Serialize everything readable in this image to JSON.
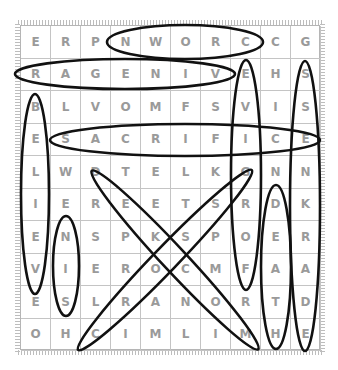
{
  "puzzle": {
    "rows": [
      [
        "E",
        "R",
        "P",
        "N",
        "W",
        "O",
        "R",
        "C",
        "C",
        "G"
      ],
      [
        "R",
        "A",
        "G",
        "E",
        "N",
        "I",
        "V",
        "E",
        "H",
        "S"
      ],
      [
        "B",
        "L",
        "V",
        "O",
        "M",
        "F",
        "S",
        "V",
        "I",
        "S"
      ],
      [
        "E",
        "S",
        "A",
        "C",
        "R",
        "I",
        "F",
        "I",
        "C",
        "E"
      ],
      [
        "L",
        "W",
        "D",
        "T",
        "E",
        "L",
        "K",
        "G",
        "N",
        "N"
      ],
      [
        "I",
        "E",
        "R",
        "E",
        "E",
        "T",
        "S",
        "R",
        "D",
        "K"
      ],
      [
        "E",
        "N",
        "S",
        "P",
        "K",
        "S",
        "P",
        "O",
        "E",
        "R"
      ],
      [
        "V",
        "I",
        "E",
        "R",
        "O",
        "C",
        "M",
        "F",
        "A",
        "A"
      ],
      [
        "E",
        "S",
        "L",
        "R",
        "A",
        "N",
        "O",
        "R",
        "T",
        "D"
      ],
      [
        "O",
        "H",
        "C",
        "I",
        "M",
        "L",
        "I",
        "M",
        "H",
        "E"
      ]
    ],
    "found_words": [
      {
        "word": "CROWN",
        "direction": "horizontal-reversed",
        "row": 1,
        "from_col": 4,
        "to_col": 8
      },
      {
        "word": "VINEGAR",
        "direction": "horizontal-reversed",
        "row": 2,
        "from_col": 1,
        "to_col": 7
      },
      {
        "word": "SACRIFICE",
        "direction": "horizontal",
        "row": 4,
        "from_col": 2,
        "to_col": 10
      },
      {
        "word": "BELIEVE",
        "direction": "vertical",
        "col": 1,
        "from_row": 3,
        "to_row": 9
      },
      {
        "word": "SIN",
        "direction": "vertical-reversed",
        "col": 2,
        "from_row": 7,
        "to_row": 9
      },
      {
        "word": "FORGIVE",
        "direction": "vertical-reversed",
        "col": 8,
        "from_row": 2,
        "to_row": 8
      },
      {
        "word": "DARKNESS",
        "direction": "vertical-reversed",
        "col": 10,
        "from_row": 2,
        "to_row": 9
      },
      {
        "word": "DEATH",
        "direction": "vertical",
        "col": 9,
        "from_row": 6,
        "to_row": 10
      },
      {
        "word": "MOCKED",
        "direction": "diagonal-reversed",
        "from": [
          5,
          3
        ],
        "to": [
          10,
          8
        ]
      },
      {
        "word": "CROSS",
        "direction": "diagonal-reversed",
        "from": [
          6,
          7
        ],
        "to": [
          10,
          3
        ]
      }
    ],
    "colors": {
      "letter": "#9a9a9a",
      "grid_line": "#c4c4c4",
      "circle_stroke": "#111111"
    }
  }
}
